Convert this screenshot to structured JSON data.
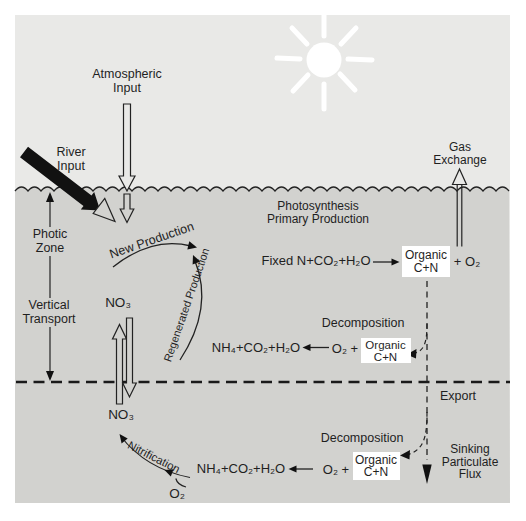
{
  "colors": {
    "page_bg": "#ffffff",
    "sky": "#e9e9e7",
    "water": "#d2d2cf",
    "ink": "#1f1f1f",
    "organic_box_bg": "#ffffff"
  },
  "labels": {
    "atmospheric_input": "Atmospheric\nInput",
    "river_input": "River\nInput",
    "photic_zone": "Photic\nZone",
    "vertical_transport": "Vertical\nTransport",
    "gas_exchange": "Gas\nExchange",
    "photosynthesis": "Photosynthesis\nPrimary Production",
    "new_production": "New Production",
    "regenerated_production": "Regenerated Production",
    "nitrification": "Nitrification",
    "decomposition_upper": "Decomposition",
    "decomposition_lower": "Decomposition",
    "export": "Export",
    "sinking_particulate_flux": "Sinking\nParticulate\nFlux"
  },
  "chemistry": {
    "no3_photic": "NO₃",
    "no3_deep": "NO₃",
    "photosynthesis_reactants": "Fixed N+CO₂+H₂O",
    "organic_cn": "Organic\nC+N",
    "plus_o2": "+ O₂",
    "remineralization_products_upper": "NH₄+CO₂+H₂O",
    "o2_plus_upper": "O₂ +",
    "remineralization_products_deep": "NH₄+CO₂+H₂O",
    "o2_plus_deep": "O₂ +",
    "o2_deep": "O₂"
  }
}
